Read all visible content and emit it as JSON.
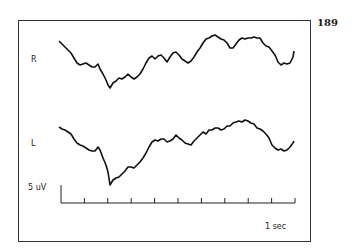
{
  "page": {
    "number": "189"
  },
  "chart_data": {
    "type": "line",
    "title": "",
    "channels": [
      {
        "name": "R",
        "color": "#111111",
        "points": [
          [
            59,
            41
          ],
          [
            62,
            44
          ],
          [
            65,
            47
          ],
          [
            68,
            50
          ],
          [
            71,
            53
          ],
          [
            74,
            58
          ],
          [
            77,
            63
          ],
          [
            80,
            65
          ],
          [
            83,
            64
          ],
          [
            86,
            63
          ],
          [
            89,
            65
          ],
          [
            92,
            67
          ],
          [
            95,
            67
          ],
          [
            98,
            64
          ],
          [
            100,
            69
          ],
          [
            103,
            74
          ],
          [
            106,
            80
          ],
          [
            108,
            85
          ],
          [
            110,
            88
          ],
          [
            113,
            83
          ],
          [
            116,
            81
          ],
          [
            119,
            78
          ],
          [
            122,
            79
          ],
          [
            125,
            77
          ],
          [
            128,
            74
          ],
          [
            131,
            77
          ],
          [
            134,
            79
          ],
          [
            137,
            77
          ],
          [
            140,
            74
          ],
          [
            143,
            69
          ],
          [
            146,
            63
          ],
          [
            149,
            58
          ],
          [
            152,
            56
          ],
          [
            155,
            59
          ],
          [
            158,
            56
          ],
          [
            161,
            55
          ],
          [
            164,
            58
          ],
          [
            167,
            62
          ],
          [
            170,
            57
          ],
          [
            173,
            53
          ],
          [
            176,
            52
          ],
          [
            179,
            55
          ],
          [
            182,
            59
          ],
          [
            185,
            61
          ],
          [
            188,
            63
          ],
          [
            191,
            61
          ],
          [
            194,
            57
          ],
          [
            197,
            52
          ],
          [
            200,
            48
          ],
          [
            203,
            43
          ],
          [
            206,
            39
          ],
          [
            209,
            38
          ],
          [
            212,
            36
          ],
          [
            215,
            35
          ],
          [
            218,
            37
          ],
          [
            221,
            39
          ],
          [
            224,
            40
          ],
          [
            227,
            43
          ],
          [
            230,
            48
          ],
          [
            233,
            48
          ],
          [
            236,
            44
          ],
          [
            239,
            40
          ],
          [
            242,
            38
          ],
          [
            245,
            39
          ],
          [
            248,
            38
          ],
          [
            251,
            38
          ],
          [
            254,
            37
          ],
          [
            257,
            38
          ],
          [
            260,
            38
          ],
          [
            263,
            43
          ],
          [
            266,
            46
          ],
          [
            269,
            47
          ],
          [
            272,
            51
          ],
          [
            275,
            55
          ],
          [
            278,
            62
          ],
          [
            281,
            65
          ],
          [
            284,
            63
          ],
          [
            287,
            64
          ],
          [
            290,
            63
          ],
          [
            293,
            57
          ],
          [
            294,
            51
          ]
        ]
      },
      {
        "name": "L",
        "color": "#111111",
        "points": [
          [
            59,
            127
          ],
          [
            62,
            129
          ],
          [
            65,
            130
          ],
          [
            68,
            132
          ],
          [
            71,
            134
          ],
          [
            74,
            139
          ],
          [
            77,
            143
          ],
          [
            80,
            145
          ],
          [
            83,
            146
          ],
          [
            86,
            148
          ],
          [
            89,
            150
          ],
          [
            92,
            151
          ],
          [
            95,
            151
          ],
          [
            98,
            147
          ],
          [
            100,
            150
          ],
          [
            103,
            158
          ],
          [
            106,
            165
          ],
          [
            108,
            172
          ],
          [
            110,
            185
          ],
          [
            113,
            180
          ],
          [
            116,
            178
          ],
          [
            119,
            177
          ],
          [
            122,
            174
          ],
          [
            125,
            171
          ],
          [
            128,
            167
          ],
          [
            131,
            167
          ],
          [
            134,
            168
          ],
          [
            137,
            165
          ],
          [
            140,
            162
          ],
          [
            143,
            158
          ],
          [
            146,
            153
          ],
          [
            149,
            147
          ],
          [
            152,
            142
          ],
          [
            155,
            140
          ],
          [
            158,
            141
          ],
          [
            161,
            139
          ],
          [
            164,
            139
          ],
          [
            167,
            142
          ],
          [
            170,
            141
          ],
          [
            173,
            139
          ],
          [
            176,
            135
          ],
          [
            179,
            138
          ],
          [
            182,
            140
          ],
          [
            185,
            143
          ],
          [
            188,
            144
          ],
          [
            191,
            145
          ],
          [
            194,
            141
          ],
          [
            197,
            138
          ],
          [
            200,
            135
          ],
          [
            203,
            132
          ],
          [
            206,
            134
          ],
          [
            209,
            130
          ],
          [
            212,
            130
          ],
          [
            215,
            128
          ],
          [
            218,
            128
          ],
          [
            221,
            130
          ],
          [
            224,
            129
          ],
          [
            227,
            126
          ],
          [
            230,
            126
          ],
          [
            233,
            123
          ],
          [
            236,
            122
          ],
          [
            239,
            121
          ],
          [
            242,
            122
          ],
          [
            245,
            120
          ],
          [
            248,
            121
          ],
          [
            251,
            123
          ],
          [
            254,
            124
          ],
          [
            257,
            128
          ],
          [
            260,
            129
          ],
          [
            263,
            131
          ],
          [
            266,
            134
          ],
          [
            269,
            138
          ],
          [
            272,
            145
          ],
          [
            275,
            148
          ],
          [
            278,
            150
          ],
          [
            281,
            149
          ],
          [
            284,
            151
          ],
          [
            287,
            150
          ],
          [
            290,
            147
          ],
          [
            293,
            143
          ],
          [
            294,
            141
          ]
        ]
      }
    ],
    "scale_bar": {
      "amplitude_label": "5 uV",
      "time_label": "1 sec"
    },
    "x_axis": {
      "x_start": 61,
      "x_end": 295,
      "y": 203,
      "tick_count": 11
    },
    "xlabel": "1 sec",
    "ylabel": "5 uV",
    "legend": [
      "R",
      "L"
    ],
    "grid": false
  },
  "labels": {
    "channel_r": "R",
    "channel_l": "L",
    "amplitude": "5 uV",
    "time": "1 sec"
  }
}
